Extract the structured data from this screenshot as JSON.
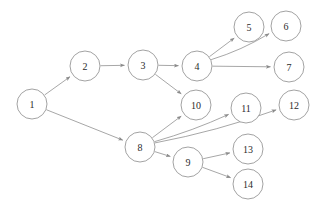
{
  "diagram": {
    "type": "directed-graph",
    "width": 318,
    "height": 207,
    "background_color": "#ffffff",
    "node_fill_color": "#ffffff",
    "node_stroke_color": "#8a8a8a",
    "edge_color": "#8a8a8a",
    "label_color": "#2b2b2b",
    "node_radius": 15,
    "nodes": [
      {
        "id": "1",
        "label": "1",
        "x": 32,
        "y": 104
      },
      {
        "id": "2",
        "label": "2",
        "x": 85,
        "y": 66
      },
      {
        "id": "3",
        "label": "3",
        "x": 143,
        "y": 65
      },
      {
        "id": "4",
        "label": "4",
        "x": 197,
        "y": 66
      },
      {
        "id": "5",
        "label": "5",
        "x": 249,
        "y": 27
      },
      {
        "id": "6",
        "label": "6",
        "x": 286,
        "y": 26
      },
      {
        "id": "7",
        "label": "7",
        "x": 289,
        "y": 67
      },
      {
        "id": "8",
        "label": "8",
        "x": 140,
        "y": 147
      },
      {
        "id": "9",
        "label": "9",
        "x": 188,
        "y": 162
      },
      {
        "id": "10",
        "label": "10",
        "x": 196,
        "y": 105
      },
      {
        "id": "11",
        "label": "11",
        "x": 246,
        "y": 108
      },
      {
        "id": "12",
        "label": "12",
        "x": 294,
        "y": 105
      },
      {
        "id": "13",
        "label": "13",
        "x": 248,
        "y": 149
      },
      {
        "id": "14",
        "label": "14",
        "x": 248,
        "y": 184
      }
    ],
    "edges": [
      {
        "from": "1",
        "to": "2",
        "curve": 0
      },
      {
        "from": "1",
        "to": "8",
        "curve": 0
      },
      {
        "from": "2",
        "to": "3",
        "curve": 0
      },
      {
        "from": "3",
        "to": "4",
        "curve": 0
      },
      {
        "from": "3",
        "to": "10",
        "curve": 0
      },
      {
        "from": "4",
        "to": "5",
        "curve": 0
      },
      {
        "from": "4",
        "to": "6",
        "curve": 4
      },
      {
        "from": "4",
        "to": "7",
        "curve": 0
      },
      {
        "from": "8",
        "to": "10",
        "curve": 0
      },
      {
        "from": "8",
        "to": "11",
        "curve": 3
      },
      {
        "from": "8",
        "to": "12",
        "curve": 5
      },
      {
        "from": "8",
        "to": "9",
        "curve": 0
      },
      {
        "from": "9",
        "to": "13",
        "curve": 0
      },
      {
        "from": "9",
        "to": "14",
        "curve": 0
      }
    ]
  }
}
